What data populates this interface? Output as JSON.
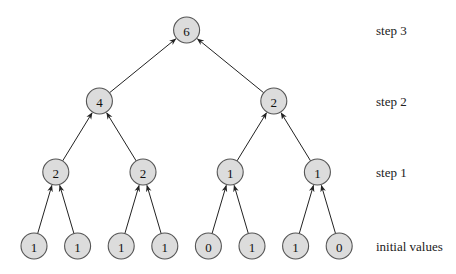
{
  "diagram": {
    "title": "",
    "levels": [
      {
        "label": "initial values",
        "values": [
          "1",
          "1",
          "1",
          "1",
          "0",
          "1",
          "1",
          "0"
        ]
      },
      {
        "label": "step 1",
        "values": [
          "2",
          "2",
          "1",
          "1"
        ]
      },
      {
        "label": "step 2",
        "values": [
          "4",
          "2"
        ]
      },
      {
        "label": "step 3",
        "values": [
          "6"
        ]
      }
    ],
    "edge_direction": "child-to-parent",
    "colors": {
      "node_fill": "#dcdcdc",
      "node_stroke": "#555555",
      "edge": "#222222"
    }
  }
}
